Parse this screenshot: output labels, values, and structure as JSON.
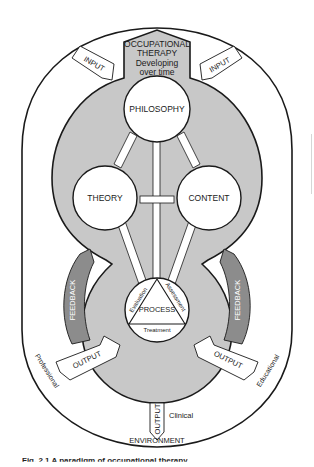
{
  "diagram": {
    "header": {
      "line1": "OCCUPATIONAL",
      "line2": "THERAPY",
      "line3": "Developing",
      "line4": "over time"
    },
    "nodes": {
      "philosophy": "PHILOSOPHY",
      "theory": "THEORY",
      "content": "CONTENT",
      "process": "PROCESS"
    },
    "process_triangle": {
      "left_side": "Evaluation",
      "right_side": "Assessment",
      "bottom_side": "Treatment"
    },
    "arrows": {
      "input_left": "INPUT",
      "input_right": "INPUT",
      "feedback_left": "FEEDBACK",
      "feedback_right": "FEEDBACK",
      "output_left": "OUTPUT",
      "output_right": "OUTPUT",
      "output_bottom": "OUTPUT"
    },
    "environment": {
      "label": "ENVIRONMENT",
      "professional": "Professional",
      "educational": "Educational",
      "clinical": "Clinical"
    },
    "colors": {
      "core_fill": "#c8c8c8",
      "feedback_fill": "#8c8c8c",
      "outline": "#1a1a1a",
      "circle_fill": "#ffffff"
    }
  },
  "caption": {
    "text": "Fig. 2.1  A paradigm of occupational therapy"
  }
}
